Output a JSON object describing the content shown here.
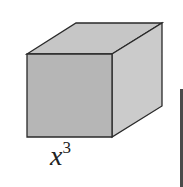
{
  "diagram": {
    "shape": "cube",
    "label": {
      "base": "x",
      "exponent": "3"
    },
    "colors": {
      "front_face": "#b4b4b4",
      "top_face": "#c4c4c4",
      "right_face": "#c9c9c9",
      "edge": "#2a2a2a",
      "partial_object": "#4a4a4a"
    }
  }
}
